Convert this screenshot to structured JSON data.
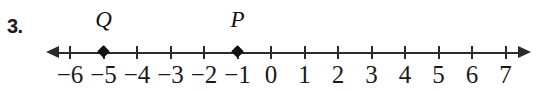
{
  "problem": {
    "number_label": "3."
  },
  "chart_data": {
    "type": "numberline",
    "title": "",
    "xlabel": "",
    "ylabel": "",
    "axis": {
      "min": -6,
      "max": 7,
      "step": 1,
      "left_arrow": true,
      "right_arrow": true,
      "grid": false
    },
    "tick_labels": [
      "−6",
      "−5",
      "−4",
      "−3",
      "−2",
      "−1",
      "0",
      "1",
      "2",
      "3",
      "4",
      "5",
      "6",
      "7"
    ],
    "tick_values": [
      -6,
      -5,
      -4,
      -3,
      -2,
      -1,
      0,
      1,
      2,
      3,
      4,
      5,
      6,
      7
    ],
    "points": [
      {
        "label": "Q",
        "value": -5
      },
      {
        "label": "P",
        "value": -1
      }
    ],
    "colors": {
      "line": "#2b2b2b",
      "point": "#111111",
      "text": "#1a1a1a"
    }
  }
}
